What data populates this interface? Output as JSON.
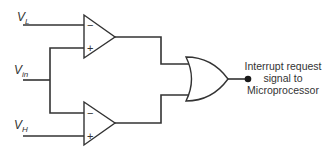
{
  "diagram": {
    "type": "window-comparator-circuit",
    "inputs": [
      {
        "id": "vl",
        "base": "V",
        "sub": "L"
      },
      {
        "id": "vin",
        "base": "V",
        "sub": "in"
      },
      {
        "id": "vh",
        "base": "V",
        "sub": "H"
      }
    ],
    "comparators": [
      {
        "id": "upper",
        "inverting_input": "vl",
        "noninverting_input": "vin",
        "minus_sign": "−",
        "plus_sign": "+"
      },
      {
        "id": "lower",
        "inverting_input": "vin",
        "noninverting_input": "vh",
        "minus_sign": "−",
        "plus_sign": "+"
      }
    ],
    "logic_gate": {
      "type": "OR"
    },
    "output": {
      "lines": [
        "Interrupt request",
        "signal to",
        "Microprocessor"
      ]
    },
    "colors": {
      "stroke": "#333333",
      "background": "#ffffff"
    }
  }
}
